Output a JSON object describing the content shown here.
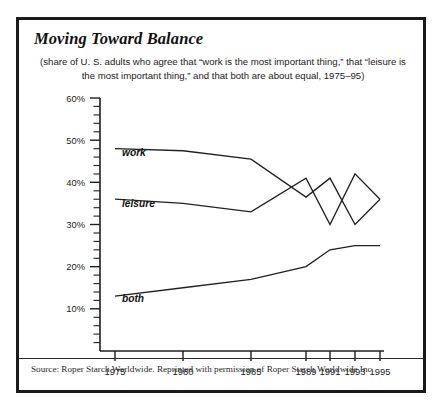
{
  "figure": {
    "title": "Moving Toward Balance",
    "subtitle": "(share of U. S. adults who agree that “work is the most important thing,” that “leisure is the most important thing,” and that both are about equal, 1975–95)",
    "source": "Source: Roper Starch Worldwide. Reprinted with permission of Roper Starch Worldwide Inc.",
    "border_color": "#1a1a1a",
    "line_color": "#212121",
    "background": "#ffffff"
  },
  "labels": {
    "work": "work",
    "leisure": "leisure",
    "both": "both"
  },
  "axis": {
    "y_ticks": [
      "60%",
      "50%",
      "40%",
      "30%",
      "20%",
      "10%"
    ],
    "x_ticks": [
      "1975",
      "1980",
      "1985",
      "1989",
      "1991",
      "1993",
      "1995"
    ]
  },
  "chart_data": {
    "type": "line",
    "title": "Moving Toward Balance",
    "subtitle": "(share of U. S. adults who agree that “work is the most important thing,” that “leisure is the most important thing,” and that both are about equal, 1975–95)",
    "xlabel": "",
    "ylabel": "",
    "x": [
      1975,
      1980,
      1985,
      1989,
      1991,
      1993,
      1995
    ],
    "categories": [
      "1975",
      "1980",
      "1985",
      "1989",
      "1991",
      "1993",
      "1995"
    ],
    "xlim": [
      1973.6,
      1996.2
    ],
    "ylim": [
      0,
      60
    ],
    "y_tick_values": [
      10,
      20,
      30,
      40,
      50,
      60
    ],
    "y_tick_labels": [
      "10%",
      "20%",
      "30%",
      "40%",
      "50%",
      "60%"
    ],
    "y_minor_step": 2,
    "grid": false,
    "legend": "inline labels at left of each series",
    "series": [
      {
        "name": "work",
        "label": "work",
        "values": [
          48,
          47.5,
          45.5,
          36.5,
          41,
          30,
          36
        ]
      },
      {
        "name": "leisure",
        "label": "leisure",
        "values": [
          36,
          35,
          33,
          41,
          30,
          42,
          36
        ]
      },
      {
        "name": "both",
        "label": "both",
        "values": [
          13,
          15,
          17,
          20,
          24,
          25,
          25
        ]
      }
    ],
    "annotations": [
      "work and leisure lines cross near 1989",
      "work and leisure converge at about 36% in 1995"
    ],
    "source": "Source: Roper Starch Worldwide. Reprinted with permission of Roper Starch Worldwide Inc."
  }
}
